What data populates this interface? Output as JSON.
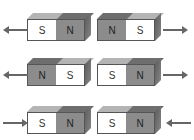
{
  "colors": {
    "north": "#8c8c8c",
    "south": "#ffffff",
    "north_top": "#6e6e6e",
    "south_top": "#b4b4b4",
    "side": "#5a5a5a",
    "arrow": "#666666"
  },
  "rows": [
    {
      "top": 13,
      "magnets": [
        {
          "left": 27,
          "poles": [
            "S",
            "N"
          ]
        },
        {
          "left": 97,
          "poles": [
            "N",
            "S"
          ]
        }
      ],
      "arrows": [
        {
          "dir": "left",
          "x": 3
        },
        {
          "dir": "right",
          "x": 163
        }
      ]
    },
    {
      "top": 58,
      "magnets": [
        {
          "left": 27,
          "poles": [
            "N",
            "S"
          ]
        },
        {
          "left": 97,
          "poles": [
            "S",
            "N"
          ]
        }
      ],
      "arrows": [
        {
          "dir": "left",
          "x": 3
        },
        {
          "dir": "right",
          "x": 163
        }
      ]
    },
    {
      "top": 106,
      "magnets": [
        {
          "left": 27,
          "poles": [
            "S",
            "N"
          ]
        },
        {
          "left": 97,
          "poles": [
            "S",
            "N"
          ]
        }
      ],
      "arrows": [
        {
          "dir": "right",
          "x": 3
        },
        {
          "dir": "left",
          "x": 166
        }
      ]
    }
  ]
}
